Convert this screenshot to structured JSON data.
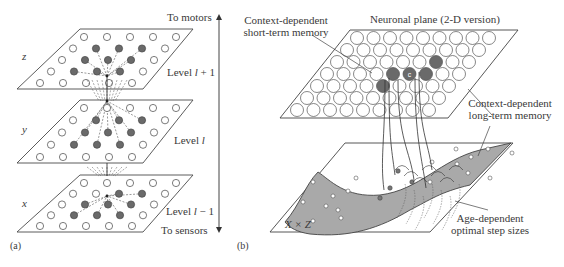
{
  "figure": {
    "panel_a": {
      "tag": "(a)",
      "top_arrow_label": "To motors",
      "bottom_arrow_label": "To sensors",
      "levels": [
        {
          "axis_label": "z",
          "level_prefix": "Level ",
          "level_var": "l",
          "level_suffix": " + 1"
        },
        {
          "axis_label": "y",
          "level_prefix": "Level ",
          "level_var": "l",
          "level_suffix": ""
        },
        {
          "axis_label": "x",
          "level_prefix": "Level ",
          "level_var": "l",
          "level_suffix": " − 1"
        }
      ]
    },
    "panel_b": {
      "tag": "(b)",
      "plane_title": "Neuronal plane (2-D version)",
      "short_term_label_line1": "Context-dependent",
      "short_term_label_line2": "short-term memory",
      "long_term_label_line1": "Context-dependent",
      "long_term_label_line2": "long-term memory",
      "center_neuron_label": "c",
      "input_space_label": "X × Z",
      "step_size_label_line1": "Age-dependent",
      "step_size_label_line2": "optimal step sizes"
    }
  },
  "colors": {
    "line": "#4a4a4a",
    "active_neuron": "#6a6a6a",
    "inactive_neuron": "#ffffff",
    "manifold": "#a9a9a9",
    "manifold_dot": "#ffffff"
  }
}
